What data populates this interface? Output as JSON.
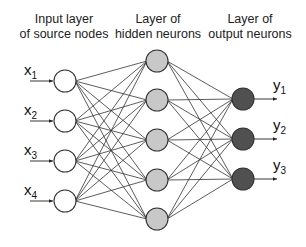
{
  "diagram": {
    "type": "feedforward-neural-network",
    "layers": [
      {
        "name": "input",
        "title_line1": "Input layer",
        "title_line2": "of source nodes",
        "count": 4,
        "fill": "#ffffff",
        "nodes": [
          {
            "label": "x",
            "sub": "1"
          },
          {
            "label": "x",
            "sub": "2"
          },
          {
            "label": "x",
            "sub": "3"
          },
          {
            "label": "x",
            "sub": "4"
          }
        ]
      },
      {
        "name": "hidden",
        "title_line1": "Layer of",
        "title_line2": "hidden neurons",
        "count": 5,
        "fill": "#c8c8c8"
      },
      {
        "name": "output",
        "title_line1": "Layer of",
        "title_line2": "output neurons",
        "count": 3,
        "fill": "#505050",
        "nodes": [
          {
            "label": "y",
            "sub": "1"
          },
          {
            "label": "y",
            "sub": "2"
          },
          {
            "label": "y",
            "sub": "3"
          }
        ]
      }
    ],
    "connections": "fully-connected"
  }
}
